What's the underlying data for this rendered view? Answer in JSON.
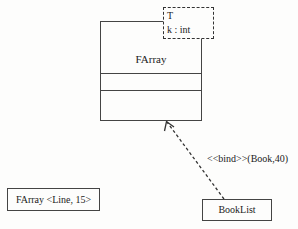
{
  "diagram": {
    "type": "uml-class-diagram",
    "template_class": {
      "name": "FArray",
      "template_parameters": [
        "T",
        "k : int"
      ]
    },
    "bound_class_anonymous": {
      "label": "FArray <Line, 15>"
    },
    "bound_class_named": {
      "name": "BookList"
    },
    "binding_relation": {
      "label": "<<bind>>(Book,40)",
      "from": "BookList",
      "to": "FArray",
      "style": "dashed-open-arrow"
    }
  }
}
